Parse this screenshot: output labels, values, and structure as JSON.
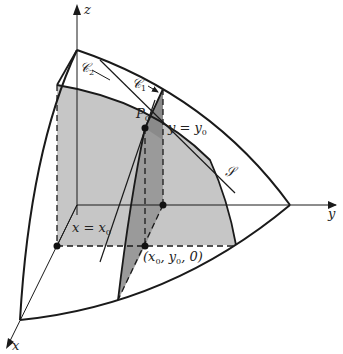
{
  "figure": {
    "colors": {
      "background": "#ffffff",
      "line": "#1a1a1a",
      "shade_light": "#c8c8c8",
      "shade_mid": "#b4b4b4",
      "shade_dark": "#8e8e8e"
    },
    "axes": {
      "x": "x",
      "y": "y",
      "z": "z"
    },
    "labels": {
      "curve1": "𝒞",
      "curve1_sub": "1",
      "curve2": "𝒞",
      "curve2_sub": "2",
      "point": "P",
      "point_sub": "0",
      "surface": "𝒮",
      "plane_y_left": "y = y",
      "plane_y_sub": "0",
      "plane_x_left": "x = x",
      "plane_x_sub": "0",
      "base_point": "(x",
      "base_point_sub0": "0",
      "base_point_mid": ", y",
      "base_point_sub1": "0",
      "base_point_end": ", 0)"
    }
  }
}
